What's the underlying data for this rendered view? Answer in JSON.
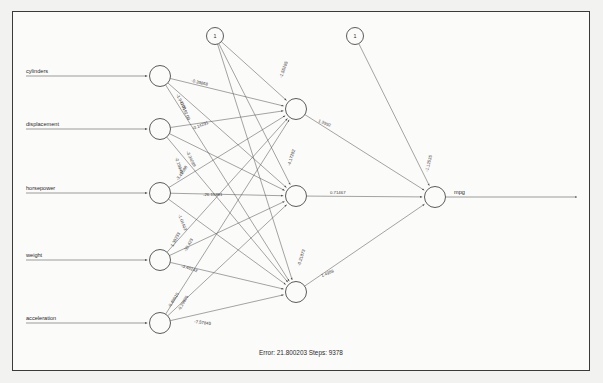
{
  "figure": {
    "type": "neural-network-diagram",
    "background_color": "#f2f2f0",
    "panel_color": "#fbfbfa",
    "border_color": "#3a3a3a",
    "line_color": "#5a5a5a",
    "footer": "Error: 21.800203   Steps: 9378",
    "error_label": "Error: 21.800203",
    "steps_label": "Steps: 9378"
  },
  "inputs": [
    {
      "label": "cylinders",
      "cx": 160,
      "cy": 76
    },
    {
      "label": "displacement",
      "cx": 160,
      "cy": 129
    },
    {
      "label": "horsepower",
      "cx": 160,
      "cy": 193
    },
    {
      "label": "weight",
      "cx": 160,
      "cy": 260
    },
    {
      "label": "acceleration",
      "cx": 160,
      "cy": 323
    }
  ],
  "hidden": [
    {
      "cx": 296,
      "cy": 109
    },
    {
      "cx": 296,
      "cy": 196
    },
    {
      "cx": 296,
      "cy": 292
    }
  ],
  "output": {
    "label": "mpg",
    "cx": 435,
    "cy": 197
  },
  "bias": [
    {
      "label": "1",
      "cx": 215,
      "cy": 36
    },
    {
      "label": "1",
      "cx": 355,
      "cy": 36
    }
  ],
  "weights": {
    "input_to_hidden": [
      {
        "text": "-0.39868",
        "x": 191,
        "y": 82,
        "rot": 13
      },
      {
        "text": "-1.94705",
        "x": 176,
        "y": 95,
        "rot": 62
      },
      {
        "text": "0.0192.00",
        "x": 180,
        "y": 103,
        "rot": 66
      },
      {
        "text": "-0.14291",
        "x": 193,
        "y": 130,
        "rot": -22
      },
      {
        "text": "-3.34089",
        "x": 186,
        "y": 152,
        "rot": 64
      },
      {
        "text": "-0.19948",
        "x": 175,
        "y": 158,
        "rot": 71
      },
      {
        "text": "-3.41588",
        "x": 178,
        "y": 181,
        "rot": -55
      },
      {
        "text": "-26.15381",
        "x": 203,
        "y": 196,
        "rot": 0
      },
      {
        "text": "-1.04403",
        "x": 178,
        "y": 215,
        "rot": 68
      },
      {
        "text": "1.38233",
        "x": 173,
        "y": 247,
        "rot": -62
      },
      {
        "text": "-32.423",
        "x": 186,
        "y": 252,
        "rot": -60
      },
      {
        "text": "-3.46142",
        "x": 181,
        "y": 267,
        "rot": 18
      },
      {
        "text": "-0.49915",
        "x": 170,
        "y": 308,
        "rot": -58
      },
      {
        "text": "-0.29826",
        "x": 180,
        "y": 311,
        "rot": -60
      },
      {
        "text": "-7.57845",
        "x": 194,
        "y": 323,
        "rot": 7
      }
    ],
    "bias_to_hidden": [
      {
        "text": "-1.55285",
        "x": 282,
        "y": 78,
        "rot": -70
      },
      {
        "text": "-4.17282",
        "x": 290,
        "y": 166,
        "rot": -72
      },
      {
        "text": "-0.21873",
        "x": 300,
        "y": 266,
        "rot": -72
      }
    ],
    "hidden_to_output": [
      {
        "text": "1.3992",
        "x": 318,
        "y": 122,
        "rot": 22
      },
      {
        "text": "0.71467",
        "x": 330,
        "y": 194,
        "rot": 0
      },
      {
        "text": "1.4988",
        "x": 322,
        "y": 277,
        "rot": -22
      }
    ],
    "bias_to_output": [
      {
        "text": "-1.12535",
        "x": 428,
        "y": 172,
        "rot": -76
      }
    ]
  }
}
